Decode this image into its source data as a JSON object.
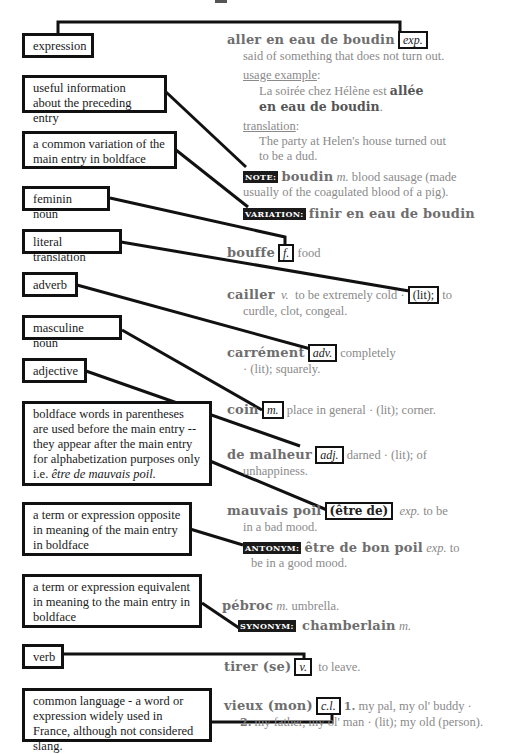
{
  "callouts": {
    "expression": "expression",
    "useful_info": "useful information about the preceding entry",
    "variation": "a common variation of the main entry in boldface",
    "feminine": "feminin noun",
    "literal": "literal translation",
    "adverb": "adverb",
    "masculine": "masculine noun",
    "adjective": "adjective",
    "parentheses_l1": "boldface words in parentheses",
    "parentheses_l2": "are used before the main entry --",
    "parentheses_l3": "they appear after the main entry",
    "parentheses_l4": "for alphabetization purposes only",
    "parentheses_l5_prefix": "i.e. ",
    "parentheses_l5_example": "être de mauvais poil.",
    "antonym": "a term or expression opposite in meaning of the main entry in boldface",
    "synonym": "a term or expression equivalent in meaning to the main entry in boldface",
    "verb": "verb",
    "common_language": "common language - a word or expression widely used in France, although not considered slang."
  },
  "entries": {
    "aller": {
      "headword": "aller en eau de boudin",
      "tag": "exp.",
      "definition": "said of something that does not turn out.",
      "usage_label": "usage example",
      "usage_text_1": "La soirée chez Hélène est ",
      "usage_bold_1": "allée",
      "usage_bold_2": "en eau de boudin",
      "usage_end": ".",
      "translation_label": "translation",
      "translation_text_1": "The party at Helen's house turned out",
      "translation_text_2": "to be a dud.",
      "note_label": "NOTE:",
      "note_word": "boudin",
      "note_gender": "m.",
      "note_text_1": " blood sausage (made",
      "note_text_2": "usually of the coagulated blood of a pig).",
      "variation_label": "VARIATION:",
      "variation_text": "finir en eau de boudin"
    },
    "bouffe": {
      "headword": "bouffe",
      "tag": "f.",
      "definition": "food"
    },
    "cailler": {
      "headword": "cailler",
      "pos": "v.",
      "definition": "to be extremely cold ·",
      "tag": "(lit);",
      "rest_1": "to",
      "rest_2": "curdle, clot, congeal."
    },
    "carrement": {
      "headword": "carrément",
      "tag": "adv.",
      "definition": "completely",
      "rest": "· (lit); squarely."
    },
    "coin": {
      "headword": "coin",
      "tag": "m.",
      "definition": "place in general · (lit); corner."
    },
    "malheur": {
      "headword": "de malheur",
      "tag": "adj.",
      "definition": "darned · (lit); of",
      "rest": "unhappiness."
    },
    "mauvais": {
      "headword": "mauvais poil",
      "tag": "(être de)",
      "pos": "exp.",
      "definition": " to be",
      "rest": "in a bad mood.",
      "antonym_label": "ANTONYM:",
      "antonym_word": "être de bon poil",
      "antonym_pos": "exp.",
      "antonym_def_1": " to",
      "antonym_def_2": "be in a good mood."
    },
    "pebroc": {
      "headword": "pébroc",
      "pos": "m.",
      "definition": " umbrella.",
      "synonym_label": "SYNONYM:",
      "synonym_word": "chamberlain",
      "synonym_pos": "m."
    },
    "tirer": {
      "headword": "tirer (se)",
      "tag": "v.",
      "definition": "to leave."
    },
    "vieux": {
      "headword": "vieux (mon)",
      "tag": "c.l.",
      "num1": "1.",
      "def1": " my pal, my ol' buddy ·",
      "num2": "2.",
      "def2": " my father, my ol' man · (lit); my old (person)."
    }
  }
}
